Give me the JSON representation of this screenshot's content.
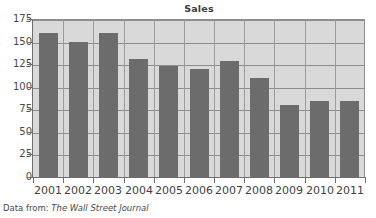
{
  "chart_data": {
    "type": "bar",
    "title": "Sales",
    "xlabel": "",
    "ylabel": "",
    "categories": [
      "2001",
      "2002",
      "2003",
      "2004",
      "2005",
      "2006",
      "2007",
      "2008",
      "2009",
      "2010",
      "2011"
    ],
    "values": [
      160,
      150,
      160,
      131,
      123,
      120,
      129,
      110,
      80,
      84,
      84
    ],
    "ylim": [
      0,
      175
    ],
    "yticks": [
      0,
      25,
      50,
      75,
      100,
      125,
      150,
      175
    ],
    "ytick_labels": [
      "0",
      "25",
      "50",
      "75",
      "100",
      "125",
      "150",
      "175"
    ],
    "grid": true,
    "grid_axis": "y",
    "legend": false,
    "bar_color": "#6c6c6c",
    "plot_background": "#d9d9d9",
    "figure_background": "#ffffff",
    "grid_color": "#8d8d8d",
    "axis_color": "#6e6e6e"
  },
  "source_note": {
    "prefix": "Data from: ",
    "publication": "The Wall Street Journal"
  }
}
